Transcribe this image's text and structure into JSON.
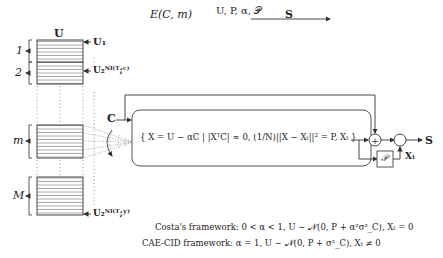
{
  "title": {
    "lhs": "E(C, m)",
    "arrow_label": "U, P, α, 𝒫",
    "rhs": "S"
  },
  "codebook": {
    "header": "U",
    "first_codeword": "U₁",
    "mid_codeword": "U₂ᴺᴵ⁽ᵁ;ᶜ⁾",
    "last_codeword": "U₂ᴺᴵ⁽ᵁ;ʸ⁾",
    "bins": [
      {
        "label": "1"
      },
      {
        "label": "2"
      },
      {
        "label": "m"
      },
      {
        "label": "M"
      }
    ]
  },
  "state_input": "C",
  "selection_set": "{ X = U − αC | |XᵀC| ≈ 0, (1/N)||X − Xₜ||² = P, Xₜ }",
  "power_block": "𝒫",
  "feedback_label": "Xₜ",
  "output": "S",
  "adder_symbol": "+",
  "captions": [
    "Costa's framework: 0 < α < 1, U ∼ 𝒩(0, P + α²σ²_C), Xₜ = 0",
    "CAE-CID framework: α = 1, U ∼ 𝒩(0, P + σ²_C), Xₜ ≠ 0"
  ]
}
